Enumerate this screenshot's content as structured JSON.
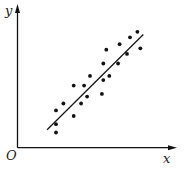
{
  "chart_data": {
    "type": "scatter",
    "title": "",
    "xlabel": "x",
    "ylabel": "y",
    "origin_label": "O",
    "grid": false,
    "legend": null,
    "xlim": [
      0,
      100
    ],
    "ylim": [
      0,
      100
    ],
    "points": [
      {
        "x": 26,
        "y": 27
      },
      {
        "x": 26,
        "y": 17
      },
      {
        "x": 26,
        "y": 11
      },
      {
        "x": 31,
        "y": 32
      },
      {
        "x": 38,
        "y": 45
      },
      {
        "x": 38,
        "y": 23
      },
      {
        "x": 43,
        "y": 32
      },
      {
        "x": 45,
        "y": 45
      },
      {
        "x": 47,
        "y": 37
      },
      {
        "x": 49,
        "y": 52
      },
      {
        "x": 57,
        "y": 39
      },
      {
        "x": 58,
        "y": 61
      },
      {
        "x": 58,
        "y": 49
      },
      {
        "x": 60,
        "y": 71
      },
      {
        "x": 62,
        "y": 52
      },
      {
        "x": 68,
        "y": 61
      },
      {
        "x": 69,
        "y": 75
      },
      {
        "x": 74,
        "y": 68
      },
      {
        "x": 76,
        "y": 80
      },
      {
        "x": 81,
        "y": 84
      },
      {
        "x": 83,
        "y": 72
      }
    ],
    "trend_line": {
      "x1": 20,
      "y1": 13,
      "x2": 85,
      "y2": 82
    },
    "colors": {
      "points": "#111111",
      "line": "#111111",
      "axes": "#111111"
    }
  }
}
